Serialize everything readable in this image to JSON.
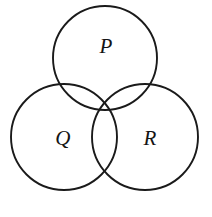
{
  "figure": {
    "background_color": "#ffffff",
    "stroke_color": "#1a1a1a",
    "label_color": "#141414",
    "stroke_width": 1.9,
    "width": 212,
    "height": 217
  },
  "chart_data": {
    "type": "diagram",
    "subtype": "venn",
    "title": "",
    "xlabel": "",
    "ylabel": "",
    "grid": false,
    "legend": "none",
    "set_count": 3,
    "sets": [
      {
        "id": "P",
        "label": "P",
        "position": "top",
        "cx": 105,
        "cy": 58,
        "r": 52,
        "label_x": 106,
        "label_y": 48
      },
      {
        "id": "Q",
        "label": "Q",
        "position": "bottom-left",
        "cx": 64,
        "cy": 137,
        "r": 53,
        "label_x": 63,
        "label_y": 140
      },
      {
        "id": "R",
        "label": "R",
        "position": "bottom-right",
        "cx": 145,
        "cy": 137,
        "r": 53,
        "label_x": 150,
        "label_y": 140
      }
    ],
    "regions": [
      "P only",
      "Q only",
      "R only",
      "P and Q",
      "P and R",
      "Q and R",
      "P and Q and R"
    ]
  }
}
